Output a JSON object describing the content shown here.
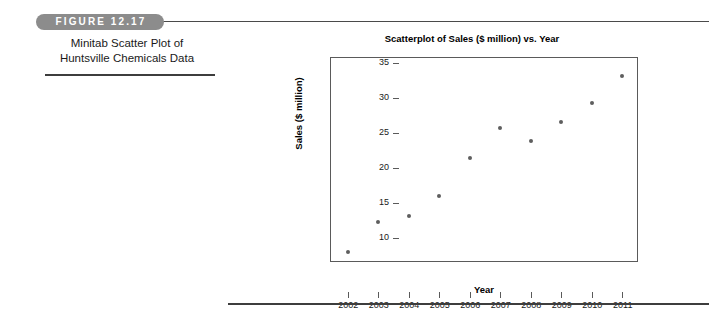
{
  "figure": {
    "number_label": "FIGURE 12.17",
    "caption_line1": "Minitab Scatter Plot of",
    "caption_line2": "Huntsville Chemicals Data",
    "capsule_color": "#8c8c8c",
    "rule_color": "#3d3d3d"
  },
  "chart_data": {
    "type": "scatter",
    "title": "Scatterplot of Sales ($ million) vs. Year",
    "xlabel": "Year",
    "ylabel": "Sales ($ million)",
    "x": [
      2002,
      2003,
      2004,
      2005,
      2006,
      2007,
      2008,
      2009,
      2010,
      2011
    ],
    "values": [
      8.0,
      12.4,
      13.2,
      16.0,
      21.4,
      25.8,
      23.9,
      26.6,
      29.3,
      33.1
    ],
    "series": [
      {
        "name": "Sales ($ million)",
        "values": [
          8.0,
          12.4,
          13.2,
          16.0,
          21.4,
          25.8,
          23.9,
          26.6,
          29.3,
          33.1
        ]
      }
    ],
    "xtick_labels": [
      "2002",
      "2003",
      "2004",
      "2005",
      "2006",
      "2007",
      "2008",
      "2009",
      "2010",
      "2011"
    ],
    "ytick_labels": [
      "35",
      "30",
      "25",
      "20",
      "15",
      "10"
    ],
    "yticks": [
      35,
      30,
      25,
      20,
      15,
      10
    ],
    "ylim": [
      6.5,
      35.7
    ],
    "xlim": [
      2001.45,
      2011.55
    ],
    "grid": false,
    "legend": false,
    "marker_color": "#5e5e5e",
    "frame_color": "#5a5a5a"
  }
}
